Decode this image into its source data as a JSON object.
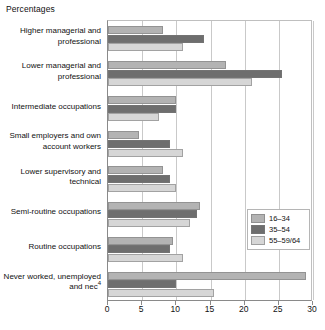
{
  "chart_data": {
    "type": "bar",
    "orientation": "horizontal",
    "title": "Percentages",
    "xlabel": "",
    "ylabel": "",
    "xlim": [
      0,
      30
    ],
    "xticks": [
      0,
      5,
      10,
      15,
      20,
      25,
      30
    ],
    "xtick_labels": [
      "0",
      "5",
      "10",
      "15",
      "20",
      "25",
      "30"
    ],
    "grid": true,
    "legend_position": "center-right",
    "categories": [
      "Higher managerial and professional",
      "Lower managerial and professional",
      "Intermediate occupations",
      "Small employers and own account workers",
      "Lower supervisory and technical",
      "Semi-routine occupations",
      "Routine occupations",
      "Never worked, unemployed and nec"
    ],
    "category_lines": [
      [
        "Higher managerial and",
        "professional"
      ],
      [
        "Lower managerial and",
        "professional"
      ],
      [
        "Intermediate occupations"
      ],
      [
        "Small employers and own",
        "account workers"
      ],
      [
        "Lower supervisory and",
        "technical"
      ],
      [
        "Semi-routine occupations"
      ],
      [
        "Routine occupations"
      ],
      [
        "Never worked, unemployed",
        "and nec"
      ]
    ],
    "category_footnotes": [
      "",
      "",
      "",
      "",
      "",
      "",
      "",
      "4"
    ],
    "series": [
      {
        "name": "16–34",
        "color": "#b3b3b3",
        "values": [
          8.0,
          17.2,
          10.0,
          4.5,
          8.0,
          13.5,
          9.5,
          29.0
        ]
      },
      {
        "name": "35–54",
        "color": "#6e6e6e",
        "values": [
          14.0,
          25.5,
          10.0,
          9.0,
          9.0,
          13.0,
          9.0,
          10.0
        ]
      },
      {
        "name": "55–59/64",
        "color": "#d6d6d6",
        "values": [
          11.0,
          21.0,
          7.5,
          11.0,
          10.0,
          12.0,
          11.0,
          15.5
        ]
      }
    ]
  },
  "legend": {
    "items": [
      {
        "label": "16–34",
        "color": "#b3b3b3"
      },
      {
        "label": "35–54",
        "color": "#6e6e6e"
      },
      {
        "label": "55–59/64",
        "color": "#d6d6d6"
      }
    ]
  }
}
